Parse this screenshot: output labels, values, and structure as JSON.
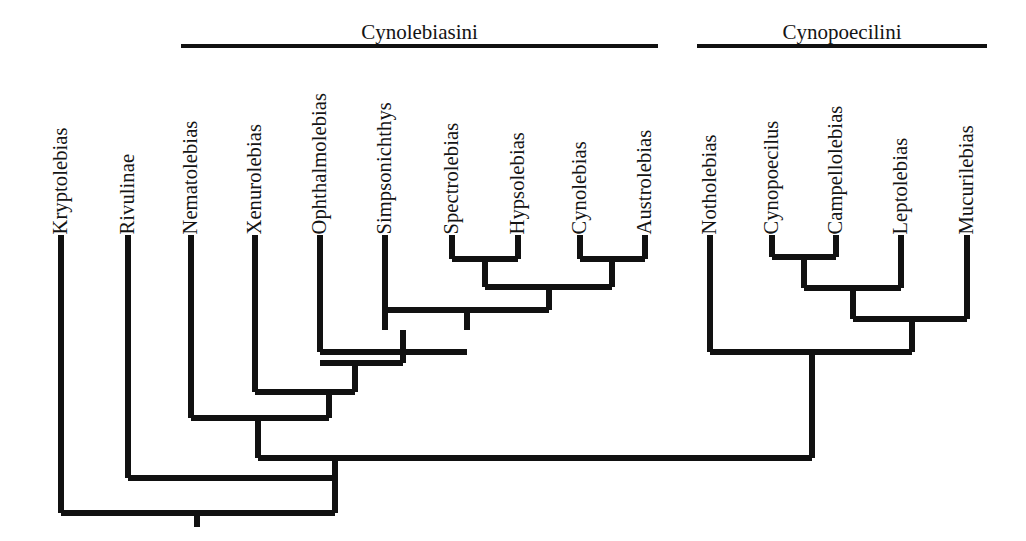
{
  "figure": {
    "type": "cladogram",
    "title": "",
    "background_color": "#ffffff",
    "line_color": "#111111"
  },
  "clade_bars": [
    {
      "name": "Cynolebiasini",
      "x": 181,
      "width": 477,
      "bar_y": 44,
      "label_y": 20
    },
    {
      "name": "Cynopoecilini",
      "x": 697,
      "width": 290,
      "bar_y": 44,
      "label_y": 20
    }
  ],
  "taxa": [
    {
      "name": "Kryptolebias",
      "x": 61,
      "tip_y": 235,
      "label_bottom_y": 228
    },
    {
      "name": "Rivulinae",
      "x": 128,
      "tip_y": 235,
      "label_bottom_y": 228
    },
    {
      "name": "Nematolebias",
      "x": 191,
      "tip_y": 235,
      "label_bottom_y": 228
    },
    {
      "name": "Xenurolebias",
      "x": 255,
      "tip_y": 235,
      "label_bottom_y": 228
    },
    {
      "name": "Ophthalmolebias",
      "x": 320,
      "tip_y": 235,
      "label_bottom_y": 228
    },
    {
      "name": "Simpsonichthys",
      "x": 385,
      "tip_y": 235,
      "label_bottom_y": 228
    },
    {
      "name": "Spectrolebias",
      "x": 452,
      "tip_y": 235,
      "label_bottom_y": 228
    },
    {
      "name": "Hypsolebias",
      "x": 518,
      "tip_y": 235,
      "label_bottom_y": 228
    },
    {
      "name": "Cynolebias",
      "x": 580,
      "tip_y": 235,
      "label_bottom_y": 228
    },
    {
      "name": "Austrolebias",
      "x": 645,
      "tip_y": 235,
      "label_bottom_y": 228
    },
    {
      "name": "Notholebias",
      "x": 710,
      "tip_y": 235,
      "label_bottom_y": 228
    },
    {
      "name": "Cynopoecilus",
      "x": 772,
      "tip_y": 235,
      "label_bottom_y": 228
    },
    {
      "name": "Campellolebias",
      "x": 836,
      "tip_y": 235,
      "label_bottom_y": 228
    },
    {
      "name": "Leptolebias",
      "x": 901,
      "tip_y": 235,
      "label_bottom_y": 228
    },
    {
      "name": "Mucurilebias",
      "x": 967,
      "tip_y": 235,
      "label_bottom_y": 228
    }
  ],
  "branch_segments": [
    {
      "id": "tip-kryptolebias",
      "orientation": "vertical",
      "x": 61,
      "y1": 235,
      "y2": 513
    },
    {
      "id": "tip-rivulinae",
      "orientation": "vertical",
      "x": 128,
      "y1": 235,
      "y2": 478
    },
    {
      "id": "tip-nematolebias",
      "orientation": "vertical",
      "x": 191,
      "y1": 235,
      "y2": 418
    },
    {
      "id": "tip-xenurolebias",
      "orientation": "vertical",
      "x": 255,
      "y1": 235,
      "y2": 392
    },
    {
      "id": "tip-ophthalmolebias",
      "orientation": "vertical",
      "x": 320,
      "y1": 235,
      "y2": 352
    },
    {
      "id": "tip-simpsonichthys",
      "orientation": "vertical",
      "x": 385,
      "y1": 235,
      "y2": 330
    },
    {
      "id": "tip-spectrolebias",
      "orientation": "vertical",
      "x": 452,
      "y1": 235,
      "y2": 259
    },
    {
      "id": "tip-hypsolebias",
      "orientation": "vertical",
      "x": 518,
      "y1": 235,
      "y2": 259
    },
    {
      "id": "tip-cynolebias",
      "orientation": "vertical",
      "x": 580,
      "y1": 235,
      "y2": 259
    },
    {
      "id": "tip-austrolebias",
      "orientation": "vertical",
      "x": 645,
      "y1": 235,
      "y2": 259
    },
    {
      "id": "tip-notholebias",
      "orientation": "vertical",
      "x": 710,
      "y1": 235,
      "y2": 352
    },
    {
      "id": "tip-cynopoecilus",
      "orientation": "vertical",
      "x": 772,
      "y1": 235,
      "y2": 257
    },
    {
      "id": "tip-campellolebias",
      "orientation": "vertical",
      "x": 836,
      "y1": 235,
      "y2": 257
    },
    {
      "id": "tip-leptolebias",
      "orientation": "vertical",
      "x": 901,
      "y1": 235,
      "y2": 288
    },
    {
      "id": "tip-mucurilebias",
      "orientation": "vertical",
      "x": 967,
      "y1": 235,
      "y2": 319
    },
    {
      "id": "node-spec-hyps-bar",
      "orientation": "horizontal",
      "y": 259,
      "x1": 452,
      "x2": 518
    },
    {
      "id": "node-spec-hyps-stem",
      "orientation": "vertical",
      "x": 485,
      "y1": 259,
      "y2": 287
    },
    {
      "id": "node-cyno-austro-bar",
      "orientation": "horizontal",
      "y": 259,
      "x1": 580,
      "x2": 645
    },
    {
      "id": "node-cyno-austro-stem",
      "orientation": "vertical",
      "x": 612,
      "y1": 259,
      "y2": 287
    },
    {
      "id": "node-fourclade-bar",
      "orientation": "horizontal",
      "y": 287,
      "x1": 485,
      "x2": 612
    },
    {
      "id": "node-fourclade-stem",
      "orientation": "vertical",
      "x": 549,
      "y1": 287,
      "y2": 310
    },
    {
      "id": "node-simpson-bar",
      "orientation": "horizontal",
      "y": 310,
      "x1": 385,
      "x2": 549
    },
    {
      "id": "node-simpson-stem",
      "orientation": "vertical",
      "x": 467,
      "y1": 310,
      "y2": 330
    },
    {
      "id": "node-ophthal-bar",
      "orientation": "horizontal",
      "y": 352,
      "x1": 320,
      "x2": 467
    },
    {
      "id": "node-ophthal-stem",
      "orientation": "vertical",
      "x": 403,
      "y1": 330,
      "y2": 363
    },
    {
      "id": "node-ophthal-bar2",
      "orientation": "horizontal",
      "y": 363,
      "x1": 320,
      "x2": 403
    },
    {
      "id": "node-xenuro-bar",
      "orientation": "horizontal",
      "y": 392,
      "x1": 255,
      "x2": 355
    },
    {
      "id": "node-xenuro-stem",
      "orientation": "vertical",
      "x": 355,
      "y1": 363,
      "y2": 392
    },
    {
      "id": "node-xenuro-down",
      "orientation": "vertical",
      "x": 329,
      "y1": 392,
      "y2": 418
    },
    {
      "id": "node-nemato-bar",
      "orientation": "horizontal",
      "y": 418,
      "x1": 191,
      "x2": 329
    },
    {
      "id": "node-nemato-stem",
      "orientation": "vertical",
      "x": 258,
      "y1": 418,
      "y2": 458
    },
    {
      "id": "node-cynopoec-cam-bar",
      "orientation": "horizontal",
      "y": 257,
      "x1": 772,
      "x2": 836
    },
    {
      "id": "node-cynopoec-cam-stem",
      "orientation": "vertical",
      "x": 804,
      "y1": 257,
      "y2": 288
    },
    {
      "id": "node-lepto-bar",
      "orientation": "horizontal",
      "y": 288,
      "x1": 804,
      "x2": 901
    },
    {
      "id": "node-lepto-stem",
      "orientation": "vertical",
      "x": 853,
      "y1": 288,
      "y2": 319
    },
    {
      "id": "node-mucuri-bar",
      "orientation": "horizontal",
      "y": 319,
      "x1": 853,
      "x2": 967
    },
    {
      "id": "node-mucuri-stem",
      "orientation": "vertical",
      "x": 912,
      "y1": 319,
      "y2": 352
    },
    {
      "id": "node-cynopoecilini-bar",
      "orientation": "horizontal",
      "y": 352,
      "x1": 710,
      "x2": 912
    },
    {
      "id": "node-cynopoecilini-stem",
      "orientation": "vertical",
      "x": 812,
      "y1": 352,
      "y2": 458
    },
    {
      "id": "node-tribes-bar",
      "orientation": "horizontal",
      "y": 458,
      "x1": 258,
      "x2": 812
    },
    {
      "id": "node-tribes-stem",
      "orientation": "vertical",
      "x": 335,
      "y1": 458,
      "y2": 478
    },
    {
      "id": "node-rivulinae-bar",
      "orientation": "horizontal",
      "y": 478,
      "x1": 128,
      "x2": 335
    },
    {
      "id": "node-rivulinae-stem",
      "orientation": "vertical",
      "x": 335,
      "y1": 478,
      "y2": 513
    },
    {
      "id": "node-root-bar",
      "orientation": "horizontal",
      "y": 513,
      "x1": 61,
      "x2": 335
    },
    {
      "id": "node-root-stem",
      "orientation": "vertical",
      "x": 197,
      "y1": 513,
      "y2": 527
    }
  ]
}
